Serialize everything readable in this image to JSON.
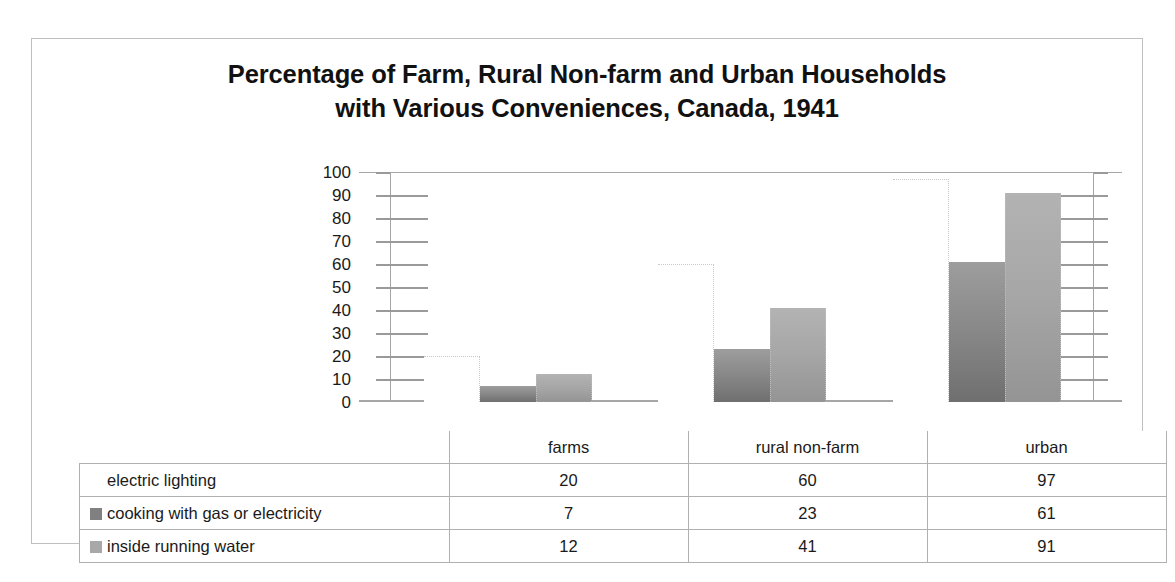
{
  "chart_data": {
    "type": "bar",
    "title": "Percentage of Farm, Rural Non-farm and Urban Households with Various Conveniences, Canada, 1941",
    "title_line1": "Percentage of Farm, Rural Non-farm and Urban Households",
    "title_line2": "with Various Conveniences, Canada, 1941",
    "xlabel": "",
    "ylabel": "",
    "ylim": [
      0,
      100
    ],
    "ytick_step": 10,
    "yticks": [
      "100",
      "90",
      "80",
      "70",
      "60",
      "50",
      "40",
      "30",
      "20",
      "10",
      "0"
    ],
    "grid": false,
    "legend_position": "data-table",
    "categories": [
      "farms",
      "rural non-farm",
      "urban"
    ],
    "series": [
      {
        "name": "electric lighting",
        "values": [
          20,
          60,
          97
        ],
        "color": "#ffffff"
      },
      {
        "name": "cooking with gas or electricity",
        "values": [
          7,
          23,
          61
        ],
        "color": "#808080"
      },
      {
        "name": "inside running water",
        "values": [
          12,
          41,
          91
        ],
        "color": "#a8a8a8"
      }
    ]
  },
  "table": {
    "header_blank": "",
    "columns": [
      "farms",
      "rural non-farm",
      "urban"
    ],
    "rows": [
      {
        "label": "electric lighting",
        "swatch": "s0",
        "values": [
          "20",
          "60",
          "97"
        ]
      },
      {
        "label": "cooking with gas or electricity",
        "swatch": "s1",
        "values": [
          "7",
          "23",
          "61"
        ]
      },
      {
        "label": "inside running water",
        "swatch": "s2",
        "values": [
          "12",
          "41",
          "91"
        ]
      }
    ]
  }
}
